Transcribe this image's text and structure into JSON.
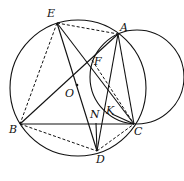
{
  "diagram": {
    "type": "geometry",
    "points": {
      "E": [
        57,
        23
      ],
      "A": [
        118,
        34
      ],
      "F": [
        92,
        60
      ],
      "O": [
        77,
        85
      ],
      "B": [
        20,
        124
      ],
      "N": [
        96,
        123
      ],
      "K": [
        112,
        114
      ],
      "C": [
        134,
        124
      ],
      "D": [
        97,
        151
      ]
    },
    "labels": [
      {
        "text": "E",
        "x": 47,
        "y": 8
      },
      {
        "text": "A",
        "x": 120,
        "y": 22
      },
      {
        "text": "F",
        "x": 94,
        "y": 56
      },
      {
        "text": "O",
        "x": 65,
        "y": 88
      },
      {
        "text": "B",
        "x": 9,
        "y": 124
      },
      {
        "text": "N",
        "x": 90,
        "y": 109
      },
      {
        "text": "K",
        "x": 106,
        "y": 105
      },
      {
        "text": "C",
        "x": 134,
        "y": 126
      },
      {
        "text": "D",
        "x": 96,
        "y": 154
      }
    ],
    "circles": [
      {
        "name": "circle-O",
        "cx": 78,
        "cy": 88,
        "r": 68
      },
      {
        "name": "circle-small",
        "cx": 137,
        "cy": 77,
        "r": 47
      }
    ],
    "solid_segments": [
      [
        "E",
        "D"
      ],
      [
        "E",
        "C"
      ],
      [
        "B",
        "A"
      ],
      [
        "A",
        "D"
      ],
      [
        "A",
        "C"
      ],
      [
        "B",
        "C"
      ],
      [
        "N",
        "D"
      ],
      [
        "K",
        "C"
      ]
    ],
    "dashed_segments": [
      [
        "E",
        "A"
      ],
      [
        "E",
        "B"
      ],
      [
        "B",
        "D"
      ],
      [
        "D",
        "C"
      ],
      [
        "F",
        "C"
      ]
    ]
  }
}
